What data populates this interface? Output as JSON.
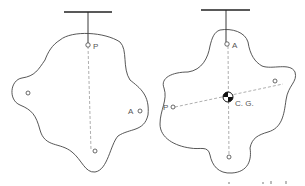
{
  "figure": {
    "left_panel": {
      "labels": {
        "suspension_point": "P",
        "other_point": "A"
      }
    },
    "right_panel": {
      "labels": {
        "suspension_point": "A",
        "other_point": "P",
        "center": "C. G."
      }
    }
  },
  "colors": {
    "line": "#333333",
    "dashed": "#999999",
    "text": "#555555"
  }
}
